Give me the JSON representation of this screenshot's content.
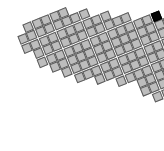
{
  "board": {
    "tile_color": "#bdbdbd",
    "border_color": "#5a5a5a",
    "highlight_color": "#050505",
    "pitch": 9.4,
    "rotation_deg": -22,
    "rows": [
      {
        "start": 1,
        "count": 5
      },
      {
        "start": 0,
        "count": 8
      },
      {
        "start": 0,
        "count": 10
      },
      {
        "start": 1,
        "count": 11
      },
      {
        "start": 1,
        "count": 13
      },
      {
        "start": 2,
        "count": 14
      },
      {
        "start": 3,
        "count": 14
      },
      {
        "start": 4,
        "count": 14
      },
      {
        "start": 6,
        "count": 12
      },
      {
        "start": 8,
        "count": 10
      },
      {
        "start": 10,
        "count": 8
      },
      {
        "start": 10,
        "count": 8
      },
      {
        "start": 11,
        "count": 6
      },
      {
        "start": 12,
        "count": 4
      }
    ],
    "special_tiles": [
      {
        "row": 4,
        "col": 14,
        "type": "dark"
      }
    ]
  }
}
